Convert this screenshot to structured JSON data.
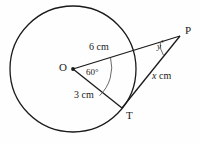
{
  "figure": {
    "background_color": "#fefefe",
    "stroke_color": "#1a1a1a",
    "labels": {
      "center": "O",
      "tangent_point": "T",
      "external_point": "P",
      "radius_upper": "6 cm",
      "radius_lower": "3 cm",
      "side_x": "x cm",
      "side_x_value": "x",
      "side_x_unit": "cm",
      "angle_at_center": "60°",
      "angle_at_center_value": "60",
      "angle_at_p_value": "y",
      "angle_at_p": "y°"
    },
    "geometry": {
      "circle": {
        "cx": 73,
        "cy": 69,
        "r": 63
      },
      "points": {
        "O": {
          "x": 73,
          "y": 69
        },
        "T": {
          "x": 122,
          "y": 108
        },
        "P": {
          "x": 180,
          "y": 36
        }
      },
      "angle_center_degrees": 60,
      "measure_O_to_edge": "6 cm",
      "measure_O_to_T": "3 cm",
      "measure_T_to_P": "x cm"
    }
  }
}
